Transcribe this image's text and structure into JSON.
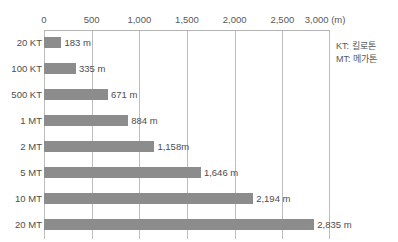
{
  "chart_data": {
    "type": "bar",
    "orientation": "horizontal",
    "title": "",
    "xlabel": "(m)",
    "ylabel": "",
    "xlim": [
      0,
      3000
    ],
    "grid": true,
    "legend_position": "right",
    "categories": [
      "20 KT",
      "100 KT",
      "500 KT",
      "1 MT",
      "2 MT",
      "5 MT",
      "10 MT",
      "20 MT"
    ],
    "values": [
      183,
      335,
      671,
      884,
      1158,
      1646,
      2194,
      2835
    ],
    "value_labels": [
      "183 m",
      "335 m",
      "671 m",
      "884 m",
      "1,158m",
      "1,646 m",
      "2,194 m",
      "2,835 m"
    ],
    "x_ticks": [
      0,
      500,
      1000,
      1500,
      2000,
      2500,
      3000
    ],
    "x_tick_labels": [
      "0",
      "500",
      "1,000",
      "1,500",
      "2,000",
      "2,500",
      "3,000"
    ],
    "x_unit_label": "(m)",
    "bar_color": "#8c8c8c",
    "gridline_color": "#bdbdbd",
    "background_color": "#ffffff",
    "text_color": "#4d4d4f"
  },
  "legend": {
    "entries": [
      {
        "text": "KT: 킬로톤"
      },
      {
        "text": "MT: 메가톤"
      }
    ]
  }
}
